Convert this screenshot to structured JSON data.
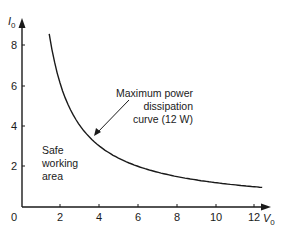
{
  "chart_data": {
    "type": "line",
    "title": "",
    "xlabel": "V",
    "xlabel_sub": "0",
    "ylabel": "I",
    "ylabel_sub": "0",
    "xlim": [
      0,
      13
    ],
    "ylim": [
      0,
      9
    ],
    "x_ticks": [
      2,
      4,
      6,
      8,
      10,
      12
    ],
    "y_ticks": [
      2,
      4,
      6,
      8
    ],
    "origin_label": "0",
    "grid": false,
    "legend": null,
    "series": [
      {
        "name": "Maximum power dissipation curve (12 W)",
        "equation": "I0 * V0 = 12",
        "power_watts": 12,
        "x": [
          1.4,
          1.5,
          1.75,
          2,
          2.5,
          3,
          3.5,
          4,
          5,
          6,
          7,
          8,
          9,
          10,
          11,
          12,
          12.35
        ],
        "y": [
          8.57,
          8.0,
          6.86,
          6.0,
          4.8,
          4.0,
          3.43,
          3.0,
          2.4,
          2.0,
          1.71,
          1.5,
          1.33,
          1.2,
          1.09,
          1.0,
          0.97
        ]
      }
    ],
    "annotations": [
      {
        "lines": [
          "Maximum power",
          "dissipation",
          "curve (12 W)"
        ],
        "align": "right",
        "arrow_to": [
          3.8,
          3.5
        ]
      },
      {
        "lines": [
          "Safe",
          "working",
          "area"
        ],
        "align": "left",
        "position": [
          1.1,
          2.9
        ]
      }
    ]
  },
  "labels": {
    "origin": "0",
    "y_axis": "I",
    "y_axis_sub": "0",
    "x_axis": "V",
    "x_axis_sub": "0",
    "y_ticks": [
      "2",
      "4",
      "6",
      "8"
    ],
    "x_ticks": [
      "2",
      "4",
      "6",
      "8",
      "10",
      "12"
    ],
    "curve_annotation": [
      "Maximum power",
      "dissipation",
      "curve (12 W)"
    ],
    "region_annotation": [
      "Safe",
      "working",
      "area"
    ]
  }
}
